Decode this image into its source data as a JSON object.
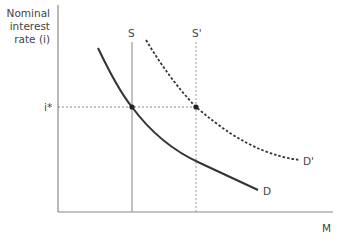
{
  "diagram": {
    "y_axis_label_lines": [
      "Nominal",
      "interest",
      "rate (i)"
    ],
    "x_axis_label": "M",
    "equilibrium_rate_label": "i*",
    "supply_curves": [
      {
        "label": "S",
        "style": "solid"
      },
      {
        "label": "S'",
        "style": "dashed"
      }
    ],
    "demand_curves": [
      {
        "label": "D",
        "style": "solid"
      },
      {
        "label": "D'",
        "style": "dashed"
      }
    ],
    "colors": {
      "axis": "#888888",
      "demand": "#333333",
      "supply": "#999999",
      "guide": "#777777",
      "point": "#222222"
    }
  }
}
